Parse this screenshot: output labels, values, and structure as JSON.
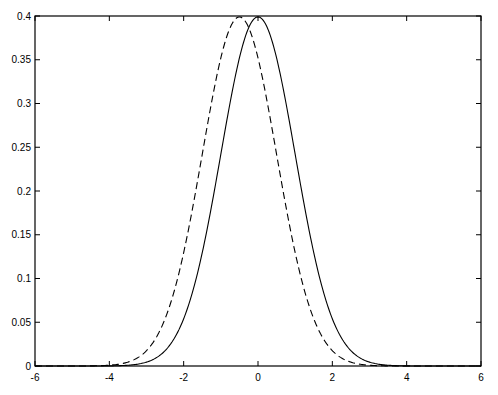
{
  "chart_data": {
    "type": "line",
    "title": "",
    "xlabel": "",
    "ylabel": "",
    "xlim": [
      -6,
      6
    ],
    "ylim": [
      0,
      0.4
    ],
    "grid": false,
    "legend": null,
    "x_ticks": [
      "-6",
      "-4",
      "-2",
      "0",
      "2",
      "4",
      "6"
    ],
    "y_ticks": [
      "0",
      "0.05",
      "0.1",
      "0.15",
      "0.2",
      "0.25",
      "0.3",
      "0.35",
      "0.4"
    ],
    "series": [
      {
        "name": "solid",
        "style": "solid",
        "description": "Standard normal density, mean 0, sd 1",
        "mean": 0,
        "sd": 1,
        "peak": 0.399
      },
      {
        "name": "dashed",
        "style": "dashed",
        "description": "Normal density shifted left, mean -0.5, sd 1",
        "mean": -0.5,
        "sd": 1,
        "peak": 0.399
      }
    ]
  }
}
